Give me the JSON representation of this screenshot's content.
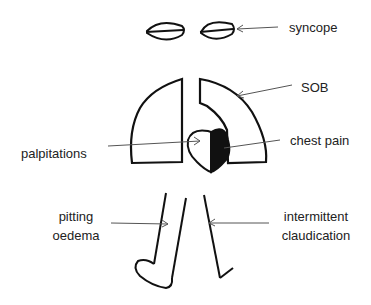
{
  "labels": {
    "syncope": "syncope",
    "sob": "SOB",
    "palpitations": "palpitations",
    "chest_pain": "chest pain",
    "pitting_oedema_line1": "pitting",
    "pitting_oedema_line2": "oedema",
    "claudication_line1": "intermittent",
    "claudication_line2": "claudication"
  },
  "colors": {
    "stroke": "#111111",
    "arrow": "#555555",
    "text": "#222222",
    "background": "#ffffff"
  }
}
